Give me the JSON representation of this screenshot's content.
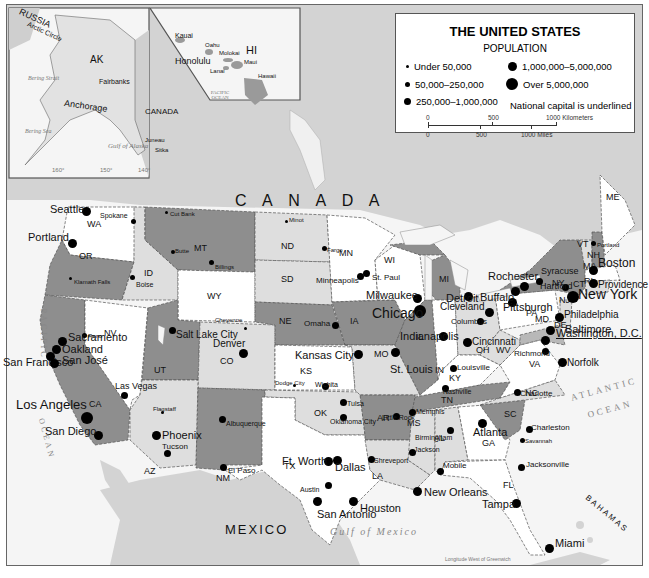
{
  "legend": {
    "title": "THE UNITED STATES",
    "subtitle": "POPULATION",
    "items": [
      {
        "label": "Under 50,000",
        "size": 3
      },
      {
        "label": "50,000–250,000",
        "size": 5
      },
      {
        "label": "250,000–1,000,000",
        "size": 7
      },
      {
        "label": "1,000,000–5,000,000",
        "size": 9
      },
      {
        "label": "Over 5,000,000",
        "size": 12
      }
    ],
    "note": "National capital is underlined",
    "scale": {
      "km_0": "0",
      "km_500": "500",
      "km_1000": "1000 Kilometers",
      "mi_0": "0",
      "mi_500": "500",
      "mi_1000": "1000 Miles"
    }
  },
  "insets": {
    "alaska": {
      "state": "AK",
      "country_russia": "RUSSIA",
      "country_canada": "CANADA",
      "arctic": "Arctic Circle",
      "bering_strait": "Bering Strait",
      "bering_sea": "Bering Sea",
      "gulf": "Gulf of Alaska",
      "lat_70": "70°",
      "lat_50": "50°",
      "lon_160": "160°",
      "lon_150": "150°",
      "lon_140": "140°",
      "lon_130": "130°",
      "cities": [
        "Fairbanks",
        "Anchorage",
        "Juneau",
        "Sitka"
      ]
    },
    "hawaii": {
      "state": "HI",
      "islands": [
        "Kauai",
        "Oahu",
        "Molokai",
        "Maui",
        "Lanai",
        "Hawaii"
      ],
      "city": "Honolulu",
      "ocean": "PACIFIC OCEAN",
      "lon_160": "160°",
      "lon_155": "155°",
      "lon_155b": "155°",
      "lat_20": "20°"
    }
  },
  "regions": {
    "canada": "C A N A D A",
    "mexico": "MEXICO",
    "pacific": "PACIFIC",
    "ocean_w": "OCEAN",
    "atlantic": "ATLANTIC",
    "ocean_e": "OCEAN",
    "gulf": "Gulf of Mexico",
    "bahamas": "BAHAMAS",
    "lake_superior": "Lake Superior",
    "lake_michigan": "L. Michigan",
    "lake_huron": "L. Huron",
    "lake_erie": "L. Erie",
    "lake_ontario": "L. Ontario",
    "great_salt_lake": "Great Salt Lake",
    "st_lawrence": "St. Lawrence R.",
    "longitude_note": "Longitude West of Greenwich"
  },
  "gridlabels": [
    "120°",
    "110°",
    "100°",
    "90°",
    "70°",
    "50°",
    "30°",
    "120°",
    "110°",
    "100°",
    "90°",
    "80°",
    "30°",
    "60°",
    "80°"
  ],
  "states": [
    "WA",
    "OR",
    "CA",
    "NV",
    "ID",
    "MT",
    "WY",
    "UT",
    "AZ",
    "CO",
    "NM",
    "ND",
    "SD",
    "NE",
    "KS",
    "OK",
    "TX",
    "MN",
    "IA",
    "MO",
    "AR",
    "LA",
    "WI",
    "IL",
    "MI",
    "IN",
    "OH",
    "KY",
    "TN",
    "MS",
    "AL",
    "GA",
    "FL",
    "SC",
    "NC",
    "VA",
    "WV",
    "PA",
    "NY",
    "VT",
    "NH",
    "ME",
    "MA",
    "CT",
    "RI",
    "NJ",
    "MD",
    "DE"
  ],
  "cities": [
    {
      "name": "Seattle",
      "size": 9
    },
    {
      "name": "Spokane",
      "size": 5
    },
    {
      "name": "Portland",
      "size": 9
    },
    {
      "name": "Cut Bank",
      "size": 3
    },
    {
      "name": "Butte",
      "size": 4
    },
    {
      "name": "Billings",
      "size": 5
    },
    {
      "name": "Boise",
      "size": 5
    },
    {
      "name": "Klamath Falls",
      "size": 3
    },
    {
      "name": "Reno",
      "size": 5
    },
    {
      "name": "Sacramento",
      "size": 9
    },
    {
      "name": "Oakland",
      "size": 9
    },
    {
      "name": "San Francisco",
      "size": 9
    },
    {
      "name": "San José",
      "size": 9
    },
    {
      "name": "Las Vegas",
      "size": 7
    },
    {
      "name": "Los Angeles",
      "size": 12
    },
    {
      "name": "San Diego",
      "size": 9
    },
    {
      "name": "Salt Lake City",
      "size": 7
    },
    {
      "name": "Cheyenne",
      "size": 3
    },
    {
      "name": "Denver",
      "size": 9
    },
    {
      "name": "Flagstaff",
      "size": 3
    },
    {
      "name": "Phoenix",
      "size": 9
    },
    {
      "name": "Tucson",
      "size": 7
    },
    {
      "name": "Albuquerque",
      "size": 7
    },
    {
      "name": "El Paso",
      "size": 7
    },
    {
      "name": "Minot",
      "size": 3
    },
    {
      "name": "Fargo",
      "size": 5
    },
    {
      "name": "Minneapolis",
      "size": 7
    },
    {
      "name": "St. Paul",
      "size": 7
    },
    {
      "name": "Omaha",
      "size": 7
    },
    {
      "name": "Kansas City",
      "size": 9
    },
    {
      "name": "Dodge City",
      "size": 3
    },
    {
      "name": "Wichita",
      "size": 7
    },
    {
      "name": "Tulsa",
      "size": 7
    },
    {
      "name": "Oklahoma City",
      "size": 7
    },
    {
      "name": "Ft. Worth",
      "size": 9
    },
    {
      "name": "Dallas",
      "size": 9
    },
    {
      "name": "Austin",
      "size": 7
    },
    {
      "name": "San Antonio",
      "size": 9
    },
    {
      "name": "Houston",
      "size": 9
    },
    {
      "name": "Shreveport",
      "size": 7
    },
    {
      "name": "Little Rock",
      "size": 7
    },
    {
      "name": "Memphis",
      "size": 7
    },
    {
      "name": "Jackson",
      "size": 7
    },
    {
      "name": "Birmingham",
      "size": 7
    },
    {
      "name": "Mobile",
      "size": 7
    },
    {
      "name": "New Orleans",
      "size": 9
    },
    {
      "name": "Milwaukee",
      "size": 9
    },
    {
      "name": "Chicago",
      "size": 12
    },
    {
      "name": "Indianapolis",
      "size": 9
    },
    {
      "name": "St. Louis",
      "size": 9
    },
    {
      "name": "Detroit",
      "size": 9
    },
    {
      "name": "Cleveland",
      "size": 9
    },
    {
      "name": "Columbus",
      "size": 7
    },
    {
      "name": "Cincinnati",
      "size": 9
    },
    {
      "name": "Louisville",
      "size": 7
    },
    {
      "name": "Nashville",
      "size": 7
    },
    {
      "name": "Atlanta",
      "size": 9
    },
    {
      "name": "Charlotte",
      "size": 7
    },
    {
      "name": "Charleston",
      "size": 7
    },
    {
      "name": "Savannah",
      "size": 5
    },
    {
      "name": "Jacksonville",
      "size": 7
    },
    {
      "name": "Tampa",
      "size": 9
    },
    {
      "name": "Miami",
      "size": 9
    },
    {
      "name": "Richmond",
      "size": 7
    },
    {
      "name": "Norfolk",
      "size": 9
    },
    {
      "name": "Washington, D.C.",
      "size": 9,
      "capital": true
    },
    {
      "name": "Baltimore",
      "size": 9
    },
    {
      "name": "Philadelphia",
      "size": 9
    },
    {
      "name": "Pittsburgh",
      "size": 9
    },
    {
      "name": "New York",
      "size": 12
    },
    {
      "name": "Hartford",
      "size": 7
    },
    {
      "name": "Providence",
      "size": 9
    },
    {
      "name": "Boston",
      "size": 9
    },
    {
      "name": "Portland",
      "size": 5
    },
    {
      "name": "Buffalo",
      "size": 9
    },
    {
      "name": "Rochester",
      "size": 9
    },
    {
      "name": "Syracuse",
      "size": 7
    }
  ],
  "colors": {
    "water": "#f4f4f4",
    "land_foreign": "#d2d2d2",
    "state_dark": "#8e8e8e",
    "state_mid": "#b8b8b8",
    "state_light": "#dedede",
    "state_white": "#ffffff"
  }
}
